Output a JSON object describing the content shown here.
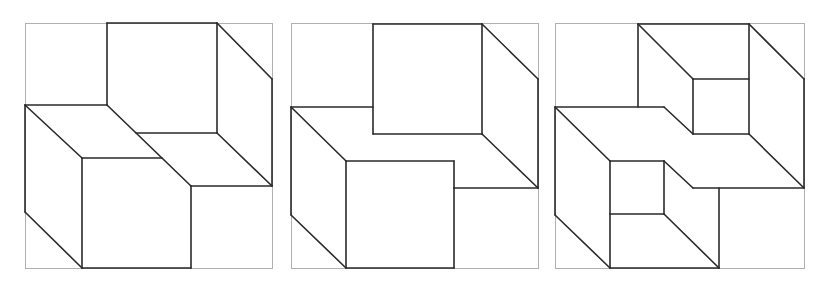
{
  "figure": {
    "colors": {
      "frame": "#b0b0b0",
      "edge": "#2a2a2a",
      "background": "#ffffff"
    },
    "panels": [
      {
        "id": "panel-1",
        "frame": [
          25,
          23,
          247,
          245
        ],
        "segments": [
          [
            107,
            23,
            217,
            23
          ],
          [
            107,
            23,
            107,
            105
          ],
          [
            217,
            23,
            217,
            133
          ],
          [
            136,
            133,
            217,
            133
          ],
          [
            217,
            23,
            272,
            79
          ],
          [
            272,
            79,
            272,
            186
          ],
          [
            217,
            133,
            272,
            186
          ],
          [
            25,
            105,
            107,
            105
          ],
          [
            25,
            105,
            82,
            158
          ],
          [
            107,
            105,
            191,
            186
          ],
          [
            82,
            158,
            162,
            158
          ],
          [
            191,
            186,
            272,
            186
          ],
          [
            25,
            105,
            25,
            212
          ],
          [
            25,
            212,
            82,
            268
          ],
          [
            82,
            158,
            82,
            268
          ],
          [
            191,
            186,
            191,
            268
          ],
          [
            82,
            268,
            191,
            268
          ]
        ]
      },
      {
        "id": "panel-2",
        "frame": [
          291,
          23,
          247,
          245
        ],
        "segments": [
          [
            373,
            24,
            482,
            24
          ],
          [
            373,
            24,
            373,
            134
          ],
          [
            482,
            24,
            482,
            134
          ],
          [
            373,
            134,
            482,
            134
          ],
          [
            482,
            24,
            538,
            79
          ],
          [
            538,
            79,
            538,
            188
          ],
          [
            482,
            134,
            538,
            188
          ],
          [
            291,
            107,
            373,
            107
          ],
          [
            291,
            107,
            346,
            161
          ],
          [
            346,
            161,
            454,
            161
          ],
          [
            454,
            161,
            454,
            188
          ],
          [
            454,
            188,
            538,
            188
          ],
          [
            291,
            107,
            291,
            215
          ],
          [
            291,
            215,
            346,
            268
          ],
          [
            346,
            161,
            346,
            268
          ],
          [
            454,
            188,
            454,
            268
          ],
          [
            346,
            268,
            454,
            268
          ]
        ]
      },
      {
        "id": "panel-3",
        "frame": [
          555,
          23,
          249,
          245
        ],
        "segments": [
          [
            638,
            24,
            749,
            24
          ],
          [
            638,
            24,
            638,
            107
          ],
          [
            638,
            24,
            693,
            79
          ],
          [
            693,
            79,
            749,
            79
          ],
          [
            693,
            79,
            693,
            134
          ],
          [
            693,
            134,
            749,
            134
          ],
          [
            749,
            24,
            749,
            134
          ],
          [
            749,
            24,
            804,
            79
          ],
          [
            804,
            79,
            804,
            188
          ],
          [
            749,
            134,
            804,
            188
          ],
          [
            555,
            107,
            664,
            107
          ],
          [
            664,
            107,
            693,
            134
          ],
          [
            555,
            107,
            610,
            161
          ],
          [
            610,
            161,
            664,
            161
          ],
          [
            664,
            161,
            693,
            188
          ],
          [
            693,
            188,
            804,
            188
          ],
          [
            610,
            161,
            610,
            268
          ],
          [
            610,
            214,
            664,
            214
          ],
          [
            664,
            161,
            664,
            214
          ],
          [
            664,
            214,
            719,
            268
          ],
          [
            719,
            188,
            719,
            268
          ],
          [
            610,
            268,
            719,
            268
          ],
          [
            555,
            107,
            555,
            215
          ],
          [
            555,
            215,
            610,
            268
          ]
        ]
      }
    ]
  }
}
